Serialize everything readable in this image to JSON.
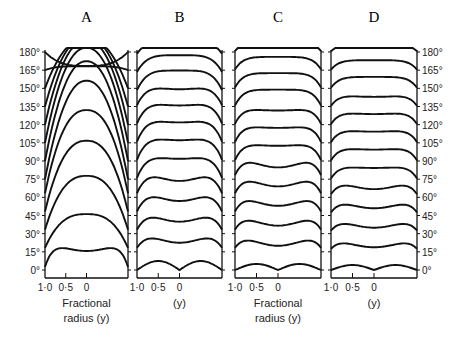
{
  "chart_data": {
    "type": "line",
    "title": "",
    "panels": [
      {
        "label": "A",
        "xlabel_lines": [
          "Fractional",
          "radius (y)"
        ]
      },
      {
        "label": "B",
        "xlabel_lines": [
          "(y)"
        ]
      },
      {
        "label": "C",
        "xlabel_lines": [
          "Fractional",
          "radius (y)"
        ]
      },
      {
        "label": "D",
        "xlabel_lines": [
          "(y)"
        ]
      }
    ],
    "x_ticks": [
      "1·0",
      "0·5",
      "0"
    ],
    "xlabel": "Fractional radius (y)",
    "ylabel": "",
    "y_ticks": [
      "0°",
      "15°",
      "30°",
      "45°",
      "60°",
      "75°",
      "90°",
      "105°",
      "120°",
      "135°",
      "150°",
      "165°",
      "180°"
    ],
    "y_tick_positions_left": "panel A",
    "y_tick_positions_right": "panel D",
    "ylim": [
      0,
      180
    ],
    "xlim": [
      1.0,
      -1.0
    ],
    "series_levels_deg": [
      0,
      15,
      30,
      45,
      60,
      75,
      90,
      105,
      120,
      135,
      150,
      165,
      180
    ],
    "grid": false,
    "legend": null
  }
}
